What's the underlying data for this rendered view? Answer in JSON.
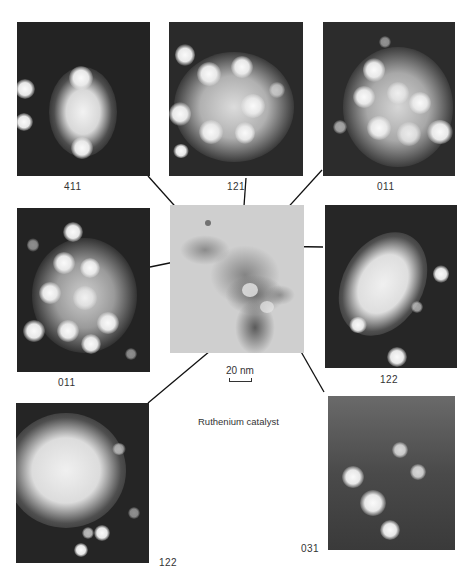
{
  "figure": {
    "caption": "Ruthenium catalyst",
    "scale_bar": "20 nm",
    "center_image": "bright-field TEM micrograph of catalyst particles",
    "panels": [
      {
        "id": "p411",
        "label": "411",
        "position": "top-left"
      },
      {
        "id": "p121",
        "label": "121",
        "position": "top-center"
      },
      {
        "id": "p011a",
        "label": "011",
        "position": "top-right"
      },
      {
        "id": "p011b",
        "label": "011",
        "position": "middle-left"
      },
      {
        "id": "p122a",
        "label": "122",
        "position": "middle-right"
      },
      {
        "id": "p122b",
        "label": "122",
        "position": "bottom-left"
      },
      {
        "id": "p031",
        "label": "031",
        "position": "bottom-right"
      }
    ],
    "colors": {
      "background": "#ffffff",
      "panel_dark": "#262626",
      "spot": "#f5f5f5",
      "micrograph": "#cfcfcf",
      "line": "#111111"
    }
  }
}
